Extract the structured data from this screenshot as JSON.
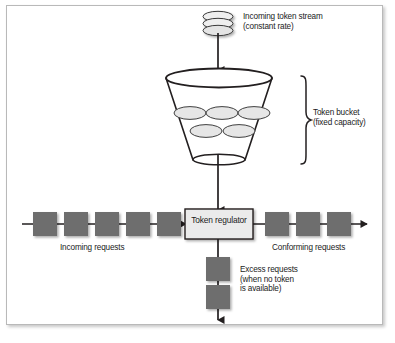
{
  "diagram": {
    "type": "flow-diagram",
    "colors": {
      "frame_border": "#b9b9b9",
      "background": "#ffffff",
      "stroke": "#231f20",
      "request_block_fill": "#6e6e6e",
      "token_fill": "#e8e8e8",
      "regulator_fill": "#ebebeb",
      "text": "#1b1b1b"
    },
    "labels": {
      "token_stream": "Incoming token stream\n(constant rate)",
      "token_bucket": "Token bucket\n(fixed capacity)",
      "regulator": "Token regulator",
      "incoming_requests": "Incoming requests",
      "conforming_requests": "Conforming requests",
      "excess_requests": "Excess requests\n(when no token\nis available)"
    },
    "counts": {
      "token_stream_discs": 3,
      "tokens_in_bucket": 5,
      "tokens_row_top": 3,
      "tokens_row_bottom": 2,
      "incoming_request_blocks": 5,
      "conforming_request_blocks": 3,
      "excess_request_blocks": 2
    }
  }
}
